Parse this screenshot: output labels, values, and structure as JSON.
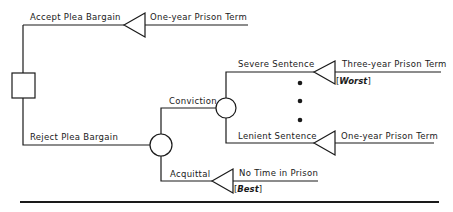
{
  "diagram": {
    "type": "decision-tree",
    "nodes": {
      "decision": {
        "shape": "square",
        "label": ""
      },
      "chance_trial": {
        "shape": "circle",
        "label": ""
      },
      "chance_sentence": {
        "shape": "circle",
        "label": ""
      }
    },
    "branches": {
      "accept": {
        "label": "Accept Plea Bargain",
        "outcome": "One-year Prison Term",
        "note": ""
      },
      "reject": {
        "label": "Reject Plea Bargain"
      },
      "conviction": {
        "label": "Conviction"
      },
      "acquittal": {
        "label": "Acquittal",
        "outcome": "No Time in  Prison",
        "note_open": "[",
        "note": "Best",
        "note_close": "]"
      },
      "severe": {
        "label": "Severe Sentence",
        "outcome": "Three-year Prison Term",
        "note_open": "[",
        "note": "Worst",
        "note_close": "]"
      },
      "lenient": {
        "label": "Lenient Sentence",
        "outcome": "One-year Prison Term"
      }
    },
    "ellipsis_dots": 3
  }
}
